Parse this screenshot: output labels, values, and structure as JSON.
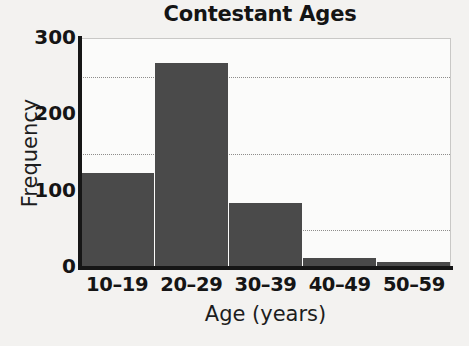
{
  "chart_data": {
    "type": "bar",
    "title": "Contestant Ages",
    "xlabel": "Age (years)",
    "ylabel": "Frequency",
    "categories": [
      "10–19",
      "20–29",
      "30–39",
      "40–49",
      "50–59"
    ],
    "values": [
      124,
      269,
      85,
      13,
      8
    ],
    "ylim": [
      0,
      300
    ],
    "yticks": [
      0,
      100,
      200,
      300
    ],
    "ytick_labels": [
      "0",
      "100",
      "200",
      "300"
    ],
    "gridlines": [
      50,
      150,
      250
    ],
    "grid": true,
    "legend": null,
    "bar_color": "#4a4a4a",
    "axis_color": "#161616",
    "grid_color": "#8e8d8b",
    "plot_background": "#fbfbfa",
    "page_background": "#f3f2f0"
  }
}
